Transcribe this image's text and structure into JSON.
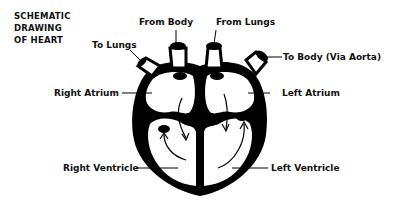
{
  "title": {
    "lines": [
      "SCHEMATIC",
      "DRAWING",
      "OF HEART"
    ]
  },
  "labels": {
    "to_lungs": "To Lungs",
    "from_body": "From Body",
    "from_lungs": "From Lungs",
    "to_body": "To Body (Via Aorta)",
    "right_atrium": "Right Atrium",
    "left_atrium": "Left Atrium",
    "right_ventricle": "Right Ventricle",
    "left_ventricle": "Left Ventricle"
  },
  "colors": {
    "ink": "#000000",
    "background": "#ffffff"
  }
}
